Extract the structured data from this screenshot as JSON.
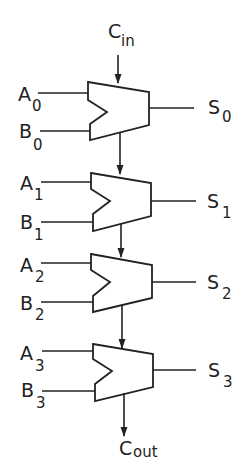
{
  "carry_in": {
    "main": "C",
    "sub": "in"
  },
  "carry_out": {
    "main": "C",
    "sub": "out"
  },
  "stages": [
    {
      "a_main": "A",
      "a_sub": "0",
      "b_main": "B",
      "b_sub": "0",
      "s_main": "S",
      "s_sub": "0"
    },
    {
      "a_main": "A",
      "a_sub": "1",
      "b_main": "B",
      "b_sub": "1",
      "s_main": "S",
      "s_sub": "1"
    },
    {
      "a_main": "A",
      "a_sub": "2",
      "b_main": "B",
      "b_sub": "2",
      "s_main": "S",
      "s_sub": "2"
    },
    {
      "a_main": "A",
      "a_sub": "3",
      "b_main": "B",
      "b_sub": "3",
      "s_main": "S",
      "s_sub": "3"
    }
  ],
  "colors": {
    "stroke": "#222222",
    "background": "#ffffff"
  }
}
